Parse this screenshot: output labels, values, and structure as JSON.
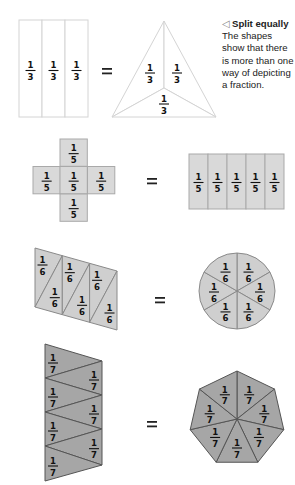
{
  "caption": {
    "arrow_icon": "◁",
    "title": "Split equally",
    "body": "The shapes show that there is more than one way of depicting a fraction."
  },
  "equals_sign": "=",
  "colors": {
    "thirds_fill": "#ffffff",
    "thirds_stroke": "#d4d4d4",
    "fifths_fill": "#d9d9d9",
    "fifths_stroke": "#a9a9a9",
    "sixths_fill": "#cfcfcf",
    "sixths_stroke": "#8a8a8a",
    "sevenths_fill": "#a6a6a6",
    "sevenths_stroke": "#555555",
    "text": "#111111"
  },
  "rows": [
    {
      "fraction": {
        "numerator": "1",
        "denominator": "3"
      },
      "parts": 3,
      "left_shape": "rectangle divided into 3 vertical strips",
      "right_shape": "triangle divided into 3 from centroid"
    },
    {
      "fraction": {
        "numerator": "1",
        "denominator": "5"
      },
      "parts": 5,
      "left_shape": "cross of 5 squares",
      "right_shape": "rectangle divided into 5 vertical strips"
    },
    {
      "fraction": {
        "numerator": "1",
        "denominator": "6"
      },
      "parts": 6,
      "left_shape": "parallelogram divided into 6 triangles",
      "right_shape": "circle divided into 6 sectors"
    },
    {
      "fraction": {
        "numerator": "1",
        "denominator": "7"
      },
      "parts": 7,
      "left_shape": "trapezoid divided into 7 zigzag triangles",
      "right_shape": "heptagon divided into 7 triangles"
    }
  ]
}
